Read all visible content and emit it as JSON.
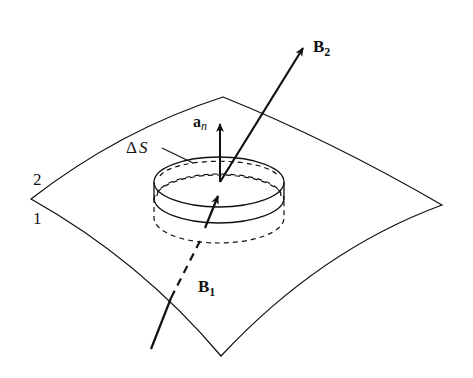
{
  "diagram": {
    "labels": {
      "region_2": "2",
      "region_1": "1",
      "delta": "Δ",
      "area": "S",
      "normal_base": "a",
      "normal_sub": "n",
      "b2_base": "B",
      "b2_sub": "2",
      "b1_base": "B",
      "b1_sub": "1"
    },
    "colors": {
      "stroke": "#111111",
      "background": "#ffffff"
    }
  }
}
